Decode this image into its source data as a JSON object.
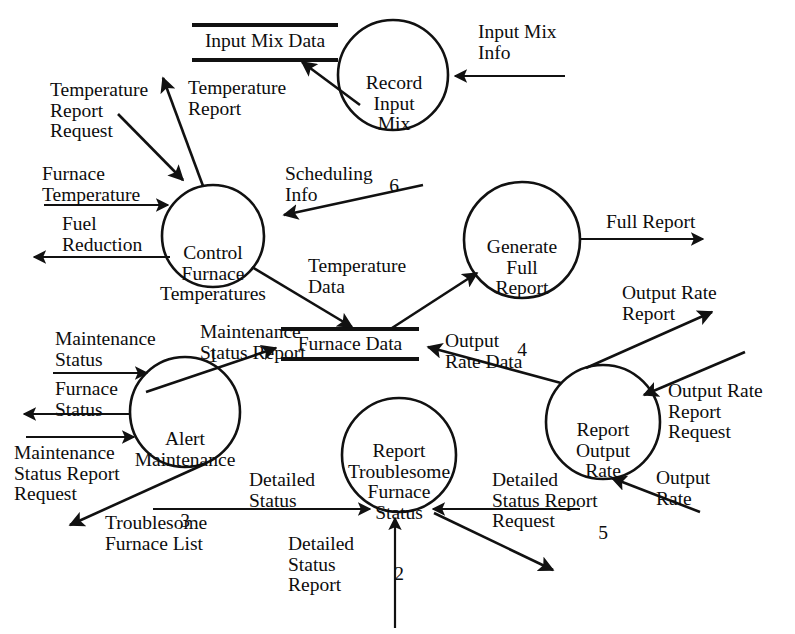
{
  "diagram": {
    "type": "data-flow-diagram",
    "title": "",
    "ink_color": "#111111",
    "background": "#ffffff",
    "processes": [
      {
        "id": "1",
        "name": "Control\nFurnace\nTemperatures",
        "number": "1",
        "cx": 213,
        "cy": 236,
        "r": 51
      },
      {
        "id": "2",
        "name": "Report\nTroublesome\nFurnace\nStatus",
        "number": "2",
        "cx": 399,
        "cy": 455,
        "r": 57
      },
      {
        "id": "3",
        "name": "Alert\nMaintenance",
        "number": "3",
        "cx": 185,
        "cy": 412,
        "r": 55
      },
      {
        "id": "4",
        "name": "Generate\nFull\nReport",
        "number": "4",
        "cx": 522,
        "cy": 240,
        "r": 58
      },
      {
        "id": "5",
        "name": "Report\nOutput\nRate",
        "number": "5",
        "cx": 603,
        "cy": 422,
        "r": 57
      },
      {
        "id": "6",
        "name": "Record\nInput\nMix",
        "number": "6",
        "cx": 393,
        "cy": 75,
        "r": 55
      }
    ],
    "data_stores": [
      {
        "id": "input-mix-data",
        "label": "Input Mix Data",
        "x1": 192,
        "x2": 338,
        "y_top": 25,
        "y_bottom": 60
      },
      {
        "id": "furnace-data",
        "label": "Furnace Data",
        "x1": 281,
        "x2": 419,
        "y_top": 329,
        "y_bottom": 359
      }
    ],
    "flows": [
      {
        "id": "temperature-report-request",
        "label": "Temperature\nReport\nRequest",
        "from": "external",
        "to": "1"
      },
      {
        "id": "temperature-report",
        "label": "Temperature\nReport",
        "from": "1",
        "to": "external"
      },
      {
        "id": "furnace-temperature",
        "label": "Furnace\nTemperature",
        "from": "external",
        "to": "1"
      },
      {
        "id": "fuel-reduction",
        "label": "Fuel\nReduction",
        "from": "1",
        "to": "external"
      },
      {
        "id": "scheduling-info",
        "label": "Scheduling\nInfo",
        "from": "external",
        "to": "1"
      },
      {
        "id": "temperature-data",
        "label": "Temperature\nData",
        "from": "1",
        "to": "furnace-data"
      },
      {
        "id": "input-mix-info",
        "label": "Input Mix\nInfo",
        "from": "external",
        "to": "6"
      },
      {
        "id": "input-mix-data-write",
        "label": "",
        "from": "6",
        "to": "input-mix-data"
      },
      {
        "id": "full-report",
        "label": "Full Report",
        "from": "4",
        "to": "external"
      },
      {
        "id": "furnace-data-to-4",
        "label": "",
        "from": "furnace-data",
        "to": "4"
      },
      {
        "id": "output-rate-data",
        "label": "Output\nRate Data",
        "from": "5",
        "to": "furnace-data"
      },
      {
        "id": "output-rate-report",
        "label": "Output Rate\nReport",
        "from": "5",
        "to": "external"
      },
      {
        "id": "output-rate-report-request",
        "label": "Output Rate\nReport\nRequest",
        "from": "external",
        "to": "5"
      },
      {
        "id": "output-rate",
        "label": "Output\nRate",
        "from": "external",
        "to": "5"
      },
      {
        "id": "maintenance-status",
        "label": "Maintenance\nStatus",
        "from": "external",
        "to": "3"
      },
      {
        "id": "furnace-status",
        "label": "Furnace\nStatus",
        "from": "3",
        "to": "external"
      },
      {
        "id": "maintenance-status-report-request",
        "label": "Maintenance\nStatus Report\nRequest",
        "from": "external",
        "to": "3"
      },
      {
        "id": "status-data",
        "label": "Status\nData",
        "from": "3",
        "to": "furnace-data"
      },
      {
        "id": "maintenance-status-report",
        "label": "Maintenance\nStatus Report",
        "from": "3",
        "to": "external"
      },
      {
        "id": "troublesome-furnace-list",
        "label": "Troublesome\nFurnace List",
        "from": "3",
        "to": "2"
      },
      {
        "id": "detailed-status",
        "label": "Detailed\nStatus",
        "from": "external",
        "to": "2"
      },
      {
        "id": "detailed-status-report-request",
        "label": "Detailed\nStatus Report\nRequest",
        "from": "external",
        "to": "2"
      },
      {
        "id": "detailed-status-report",
        "label": "Detailed\nStatus\nReport",
        "from": "2",
        "to": "external"
      }
    ]
  }
}
